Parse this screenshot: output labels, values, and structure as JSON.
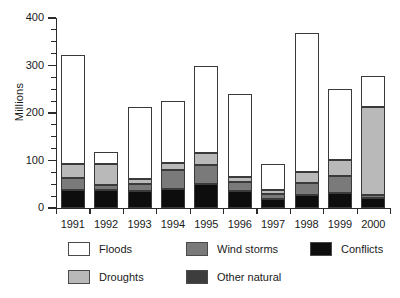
{
  "chart_data": {
    "type": "bar",
    "stacked": true,
    "title": "",
    "xlabel": "",
    "ylabel": "Millions",
    "ylim": [
      0,
      400
    ],
    "yticks": [
      0,
      100,
      200,
      300,
      400
    ],
    "ytick_labels": [
      "0",
      "100",
      "200",
      "300",
      "400"
    ],
    "minor_ticks_every": 25,
    "grid": false,
    "legend_position": "bottom",
    "categories": [
      "1991",
      "1992",
      "1993",
      "1994",
      "1995",
      "1996",
      "1997",
      "1998",
      "1999",
      "2000"
    ],
    "series": [
      {
        "name": "Floods",
        "color": "#ffffff",
        "values": [
          230,
          25,
          152,
          130,
          185,
          175,
          55,
          293,
          148,
          65
        ]
      },
      {
        "name": "Droughts",
        "color": "#b9b9b9",
        "values": [
          30,
          45,
          10,
          15,
          25,
          10,
          8,
          22,
          35,
          185
        ]
      },
      {
        "name": "Wind storms",
        "color": "#7a7a7a",
        "values": [
          25,
          10,
          15,
          40,
          40,
          20,
          12,
          25,
          35,
          8
        ]
      },
      {
        "name": "Other natural",
        "color": "#3d3d3d",
        "values": [
          0,
          0,
          0,
          0,
          0,
          0,
          0,
          0,
          0,
          0
        ]
      },
      {
        "name": "Conflicts",
        "color": "#0d0d0d",
        "values": [
          38,
          38,
          35,
          40,
          50,
          35,
          18,
          28,
          32,
          20
        ]
      }
    ],
    "totals": [
      323,
      118,
      212,
      225,
      300,
      240,
      93,
      368,
      250,
      278
    ]
  },
  "legend": {
    "items": [
      {
        "label": "Floods",
        "color": "#ffffff"
      },
      {
        "label": "Wind storms",
        "color": "#7a7a7a"
      },
      {
        "label": "Conflicts",
        "color": "#0d0d0d"
      },
      {
        "label": "Droughts",
        "color": "#b9b9b9"
      },
      {
        "label": "Other natural",
        "color": "#3d3d3d"
      }
    ]
  }
}
